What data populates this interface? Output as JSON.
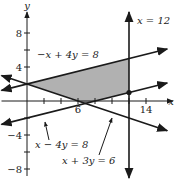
{
  "chart_data": {
    "type": "line",
    "title": "",
    "xlabel": "x",
    "ylabel": "y",
    "xlim": [
      -3,
      17
    ],
    "ylim": [
      -9,
      10
    ],
    "x_ticks": [
      2,
      4,
      6,
      8,
      10,
      12,
      14
    ],
    "x_tick_labels": [
      {
        "value": 6,
        "text": "6"
      },
      {
        "value": 14,
        "text": "14"
      }
    ],
    "y_ticks": [
      -8,
      -6,
      -4,
      -2,
      2,
      4,
      6,
      8
    ],
    "y_tick_labels": [
      {
        "value": 8,
        "text": "8"
      },
      {
        "value": 4,
        "text": "4"
      },
      {
        "value": -4,
        "text": "−4"
      },
      {
        "value": -8,
        "text": "−8"
      }
    ],
    "grid": false,
    "series": [
      {
        "name": "-x + 4y = 8",
        "label": "−x + 4y = 8",
        "kind": "line",
        "a": -1,
        "b": 4,
        "c": 8
      },
      {
        "name": "x - 4y = 8",
        "label": "x − 4y = 8",
        "kind": "line",
        "a": 1,
        "b": -4,
        "c": 8
      },
      {
        "name": "x + 3y = 6",
        "label": "x + 3y = 6",
        "kind": "line",
        "a": 1,
        "b": 3,
        "c": 6
      },
      {
        "name": "x = 12",
        "label": "x = 12",
        "kind": "vertical",
        "x": 12
      }
    ],
    "shaded_region": {
      "vertices": [
        [
          0,
          2
        ],
        [
          12,
          5
        ],
        [
          12,
          1
        ],
        [
          6.86,
          -0.29
        ]
      ],
      "color": "#a9a9a9"
    },
    "highlighted_point": [
      12,
      1
    ]
  }
}
